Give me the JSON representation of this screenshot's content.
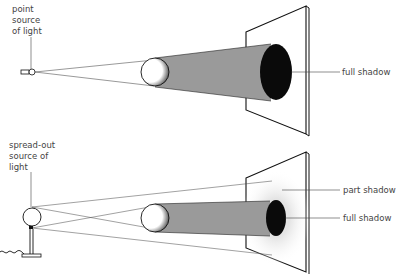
{
  "top_diagram": {
    "source_label": [
      "point",
      "source",
      "of light"
    ],
    "shadow_label": "full shadow"
  },
  "bottom_diagram": {
    "source_label": [
      "spread-out",
      "source of",
      "light"
    ],
    "part_shadow_label": "part shadow",
    "full_shadow_label": "full shadow"
  },
  "colors": {
    "ink": "#111111",
    "beam": "#9a9a9a",
    "penumbra": "#ececec",
    "label": "#444444"
  }
}
